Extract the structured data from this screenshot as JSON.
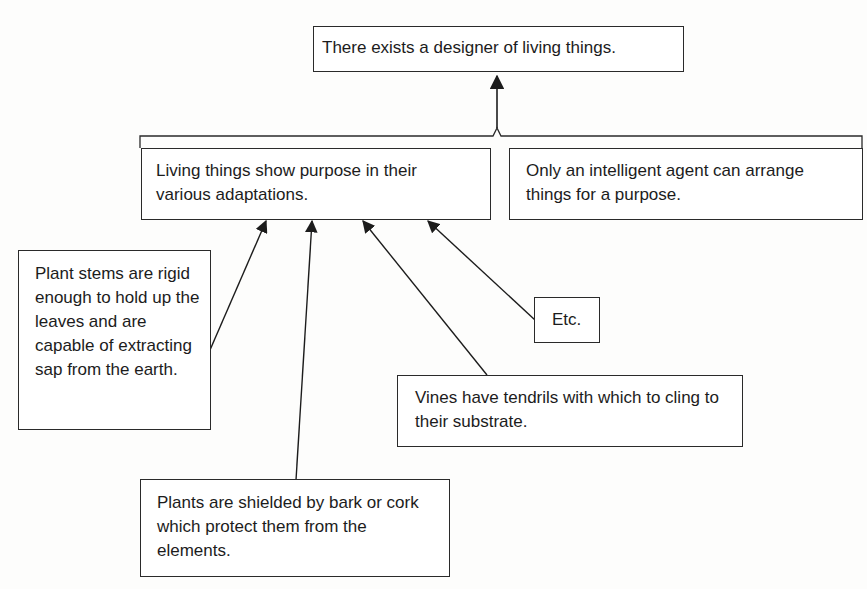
{
  "diagram": {
    "type": "argument-map",
    "conclusion": {
      "text": "There exists a designer of living things."
    },
    "premises": [
      {
        "id": "p1",
        "text": "Living things show purpose in their various adaptations."
      },
      {
        "id": "p2",
        "text": "Only an intelligent agent can arrange things for a purpose."
      }
    ],
    "supports": [
      {
        "id": "s1",
        "target": "p1",
        "text": "Plant stems are rigid enough to hold up the leaves and are capable of extracting sap from the earth."
      },
      {
        "id": "s2",
        "target": "p1",
        "text": "Plants are shielded by bark or cork which protect them from the elements."
      },
      {
        "id": "s3",
        "target": "p1",
        "text": "Vines have tendrils with which to cling to their substrate."
      },
      {
        "id": "s4",
        "target": "p1",
        "text": "Etc."
      }
    ]
  }
}
